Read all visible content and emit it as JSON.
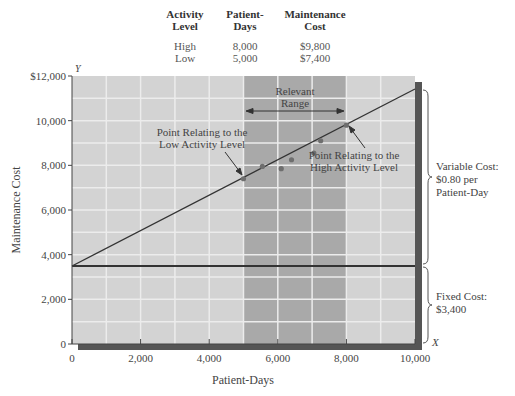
{
  "table": {
    "headers": [
      [
        "Activity",
        "Level"
      ],
      [
        "Patient-",
        "Days"
      ],
      [
        "Maintenance",
        "Cost"
      ]
    ],
    "rows": [
      [
        "High",
        "8,000",
        "$9,800"
      ],
      [
        "Low",
        "5,000",
        "$7,400"
      ]
    ]
  },
  "axes": {
    "y_letter": "Y",
    "x_letter": "X",
    "ylabel": "Maintenance Cost",
    "xlabel": "Patient-Days",
    "y_ticks": [
      "0",
      "2,000",
      "4,000",
      "6,000",
      "8,000",
      "10,000",
      "$12,000"
    ],
    "x_ticks": [
      "0",
      "2,000",
      "4,000",
      "6,000",
      "8,000",
      "10,000"
    ]
  },
  "annotations": {
    "relevant_range": [
      "Relevant",
      "Range"
    ],
    "low_point": [
      "Point Relating to the",
      "Low Activity Level"
    ],
    "high_point": [
      "Point Relating to the",
      "High Activity Level"
    ],
    "variable_cost": [
      "Variable Cost:",
      "$0.80 per",
      "Patient-Day"
    ],
    "fixed_cost": [
      "Fixed Cost:",
      "$3,400"
    ]
  },
  "colors": {
    "plot_bg": "#d3d3d3",
    "relevant_range_bg": "#a9a9a9",
    "grid": "#ececec",
    "line": "#333333",
    "points": "#6e6e6e",
    "shadow": "#555555"
  },
  "chart_data": {
    "type": "scatter",
    "title": "",
    "xlabel": "Patient-Days",
    "ylabel": "Maintenance Cost",
    "xlim": [
      0,
      10000
    ],
    "ylim": [
      0,
      12000
    ],
    "grid": true,
    "x_major_ticks": [
      0,
      2000,
      4000,
      6000,
      8000,
      10000
    ],
    "y_major_ticks": [
      0,
      2000,
      4000,
      6000,
      8000,
      10000,
      12000
    ],
    "relevant_range": [
      5000,
      8000
    ],
    "series": [
      {
        "name": "Observed maintenance cost",
        "points": [
          {
            "x": 5000,
            "y": 7400
          },
          {
            "x": 5550,
            "y": 7950
          },
          {
            "x": 6100,
            "y": 7850
          },
          {
            "x": 6400,
            "y": 8250
          },
          {
            "x": 7050,
            "y": 8550
          },
          {
            "x": 7250,
            "y": 9100
          },
          {
            "x": 8000,
            "y": 9800
          }
        ]
      },
      {
        "name": "Total cost line",
        "type": "line",
        "points": [
          {
            "x": 0,
            "y": 3400
          },
          {
            "x": 10000,
            "y": 11400
          }
        ]
      },
      {
        "name": "Fixed cost line",
        "type": "line",
        "points": [
          {
            "x": 0,
            "y": 3400
          },
          {
            "x": 10000,
            "y": 3400
          }
        ]
      }
    ],
    "table": {
      "columns": [
        "Activity Level",
        "Patient-Days",
        "Maintenance Cost"
      ],
      "rows": [
        [
          "High",
          8000,
          9800
        ],
        [
          "Low",
          5000,
          7400
        ]
      ]
    },
    "fixed_cost": 3400,
    "variable_cost_per_unit": 0.8
  }
}
